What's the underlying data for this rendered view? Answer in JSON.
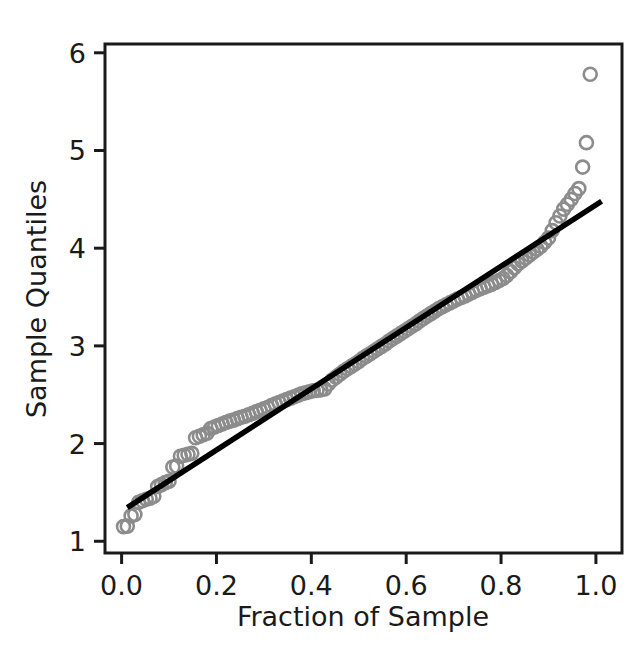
{
  "chart_data": {
    "type": "scatter",
    "title": "",
    "subtitle": "",
    "xlabel": "Fraction of Sample",
    "ylabel": "Sample Quantiles",
    "xlim": [
      -0.035,
      1.055
    ],
    "ylim": [
      0.88,
      6.09
    ],
    "xticks": [
      0.0,
      0.2,
      0.4,
      0.6,
      0.8,
      1.0
    ],
    "xtick_labels": [
      "0.0",
      "0.2",
      "0.4",
      "0.6",
      "0.8",
      "1.0"
    ],
    "yticks": [
      1,
      2,
      3,
      4,
      5,
      6
    ],
    "ytick_labels": [
      "1",
      "2",
      "3",
      "4",
      "5",
      "6"
    ],
    "grid": false,
    "legend": "none",
    "marker": {
      "shape": "open-circle",
      "color": "#8c8c8c",
      "size": 13,
      "stroke_width": 2.6,
      "fill": "none"
    },
    "reference_line": {
      "name": "fit-line",
      "color": "#000000",
      "width": 5.5,
      "x0": 0.012,
      "y0": 1.345,
      "x1": 1.012,
      "y1": 4.48
    },
    "series": [
      {
        "name": "Sample Quantiles",
        "x": [
          0.004,
          0.012,
          0.02,
          0.028,
          0.036,
          0.044,
          0.052,
          0.06,
          0.068,
          0.076,
          0.084,
          0.092,
          0.1,
          0.108,
          0.116,
          0.124,
          0.132,
          0.14,
          0.148,
          0.156,
          0.164,
          0.172,
          0.18,
          0.188,
          0.196,
          0.204,
          0.212,
          0.22,
          0.228,
          0.236,
          0.244,
          0.252,
          0.26,
          0.268,
          0.276,
          0.284,
          0.292,
          0.3,
          0.308,
          0.316,
          0.324,
          0.332,
          0.34,
          0.348,
          0.356,
          0.364,
          0.372,
          0.38,
          0.388,
          0.396,
          0.404,
          0.412,
          0.42,
          0.428,
          0.436,
          0.444,
          0.452,
          0.46,
          0.468,
          0.476,
          0.484,
          0.492,
          0.5,
          0.508,
          0.516,
          0.524,
          0.532,
          0.54,
          0.548,
          0.556,
          0.564,
          0.572,
          0.58,
          0.588,
          0.596,
          0.604,
          0.612,
          0.62,
          0.628,
          0.636,
          0.644,
          0.652,
          0.66,
          0.668,
          0.676,
          0.684,
          0.692,
          0.7,
          0.708,
          0.716,
          0.724,
          0.732,
          0.74,
          0.748,
          0.756,
          0.764,
          0.772,
          0.78,
          0.788,
          0.796,
          0.804,
          0.812,
          0.82,
          0.828,
          0.836,
          0.844,
          0.852,
          0.86,
          0.868,
          0.876,
          0.884,
          0.892,
          0.9,
          0.908,
          0.916,
          0.924,
          0.932,
          0.94,
          0.948,
          0.956,
          0.964,
          0.972,
          0.98,
          0.988
        ],
        "y": [
          1.15,
          1.155,
          1.26,
          1.275,
          1.4,
          1.415,
          1.43,
          1.44,
          1.46,
          1.56,
          1.58,
          1.6,
          1.615,
          1.76,
          1.77,
          1.87,
          1.88,
          1.89,
          1.9,
          2.06,
          2.075,
          2.09,
          2.105,
          2.155,
          2.17,
          2.185,
          2.2,
          2.215,
          2.23,
          2.24,
          2.255,
          2.27,
          2.28,
          2.295,
          2.31,
          2.325,
          2.34,
          2.355,
          2.37,
          2.39,
          2.405,
          2.42,
          2.435,
          2.45,
          2.465,
          2.48,
          2.495,
          2.51,
          2.52,
          2.53,
          2.54,
          2.545,
          2.55,
          2.56,
          2.61,
          2.65,
          2.68,
          2.71,
          2.74,
          2.765,
          2.79,
          2.815,
          2.84,
          2.87,
          2.895,
          2.92,
          2.945,
          2.97,
          2.995,
          3.02,
          3.05,
          3.075,
          3.1,
          3.125,
          3.15,
          3.175,
          3.2,
          3.225,
          3.255,
          3.28,
          3.305,
          3.33,
          3.355,
          3.38,
          3.4,
          3.42,
          3.44,
          3.46,
          3.48,
          3.495,
          3.51,
          3.53,
          3.55,
          3.57,
          3.585,
          3.6,
          3.615,
          3.63,
          3.65,
          3.67,
          3.69,
          3.72,
          3.76,
          3.8,
          3.84,
          3.87,
          3.9,
          3.93,
          3.96,
          3.99,
          4.02,
          4.06,
          4.105,
          4.18,
          4.26,
          4.33,
          4.4,
          4.45,
          4.5,
          4.56,
          4.61,
          4.83,
          5.08,
          5.78
        ]
      }
    ]
  },
  "axes": {
    "frame_color": "#1a1a1a",
    "background": "#ffffff",
    "tick_color": "#1a1a1a"
  }
}
